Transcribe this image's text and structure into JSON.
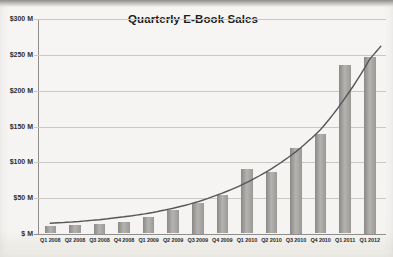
{
  "photo": {
    "description": "photographed excel chart, gray top edge"
  },
  "chart_data": {
    "type": "bar",
    "title": "Quarterly E-Book Sales",
    "xlabel": "",
    "ylabel": "",
    "categories": [
      "Q1 2008",
      "Q2 2008",
      "Q3 2008",
      "Q4 2008",
      "Q1 2009",
      "Q2 2009",
      "Q3 2009",
      "Q4 2009",
      "Q1 2010",
      "Q2 2010",
      "Q3 2010",
      "Q4 2010",
      "Q1 2011",
      "Q1 2012"
    ],
    "values": [
      11,
      12,
      14,
      17,
      24,
      34,
      44,
      55,
      91,
      86,
      120,
      140,
      236,
      247
    ],
    "unit": "USD millions",
    "ylim": [
      0,
      300
    ],
    "ytick_step": 50,
    "ytick_labels": [
      "$ M",
      "$50 M",
      "$100 M",
      "$150 M",
      "$200 M",
      "$250 M",
      "$300 M"
    ],
    "grid": true,
    "legend": "none",
    "trendline": {
      "type": "exponential",
      "values": [
        15,
        17,
        20,
        24,
        29,
        36,
        45,
        57,
        72,
        91,
        115,
        146,
        190,
        244
      ],
      "end_value": 262
    },
    "colors": {
      "bar_edge": "#8a8987",
      "bar_mid": "#b5b3b0",
      "bar_edge2": "#9b9996",
      "trendline": "#56555a",
      "gridline": "#c9c8c5",
      "axis": "#8f8e8c",
      "title_text": "#1d1d1d",
      "tick_text": "#2e2e2e",
      "background": "#f5f4f2"
    }
  }
}
